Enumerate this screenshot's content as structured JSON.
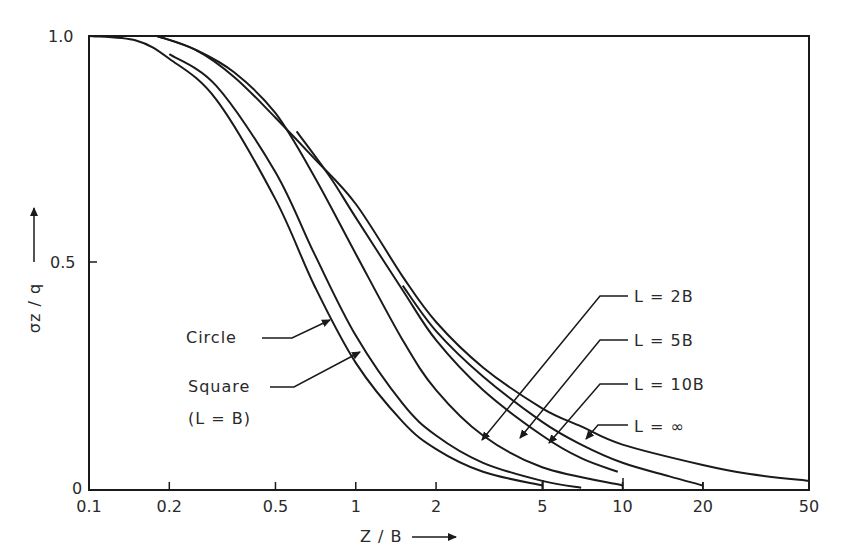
{
  "chart_data": {
    "type": "line",
    "title": "",
    "xlabel": "Z / B",
    "ylabel": "σz / q",
    "x_scale": "log",
    "xlim": [
      0.1,
      50
    ],
    "ylim": [
      0,
      1.0
    ],
    "grid": false,
    "x_ticks": [
      "0.1",
      "0.2",
      "0.5",
      "1",
      "2",
      "5",
      "10",
      "20",
      "50"
    ],
    "y_ticks": [
      "0",
      "0.5",
      "1.0"
    ],
    "legend_position": "inline annotations with arrows",
    "series": [
      {
        "name": "Circle",
        "x": [
          0.1,
          0.15,
          0.2,
          0.3,
          0.5,
          0.7,
          1,
          1.5,
          2,
          3,
          5
        ],
        "values": [
          1.0,
          0.99,
          0.95,
          0.86,
          0.64,
          0.45,
          0.28,
          0.15,
          0.09,
          0.04,
          0.01
        ]
      },
      {
        "name": "Square (L = B)",
        "x": [
          0.2,
          0.3,
          0.5,
          0.7,
          1,
          1.5,
          2,
          3,
          5,
          7
        ],
        "values": [
          0.96,
          0.89,
          0.7,
          0.52,
          0.34,
          0.19,
          0.12,
          0.06,
          0.02,
          0.005
        ]
      },
      {
        "name": "L = 2B",
        "x": [
          0.18,
          0.25,
          0.35,
          0.5,
          0.7,
          1,
          1.5,
          2,
          3,
          5,
          10
        ],
        "values": [
          1.0,
          0.97,
          0.92,
          0.83,
          0.69,
          0.52,
          0.33,
          0.22,
          0.12,
          0.05,
          0.01
        ]
      },
      {
        "name": "L = 5B",
        "x": [
          0.6,
          0.8,
          1,
          1.5,
          2,
          3,
          5,
          7,
          9.6
        ],
        "values": [
          0.79,
          0.69,
          0.6,
          0.44,
          0.33,
          0.22,
          0.12,
          0.07,
          0.04
        ]
      },
      {
        "name": "L = 10B",
        "x": [
          1.5,
          2,
          3,
          5,
          7,
          10,
          15,
          20
        ],
        "values": [
          0.45,
          0.35,
          0.25,
          0.15,
          0.1,
          0.06,
          0.03,
          0.01
        ]
      },
      {
        "name": "L = ∞",
        "x": [
          0.18,
          0.25,
          0.35,
          0.5,
          0.7,
          1,
          1.5,
          2,
          3,
          5,
          7,
          10,
          20,
          30,
          50
        ],
        "values": [
          1.0,
          0.97,
          0.91,
          0.82,
          0.73,
          0.63,
          0.47,
          0.37,
          0.27,
          0.18,
          0.14,
          0.1,
          0.055,
          0.035,
          0.02
        ]
      }
    ],
    "annotations": [
      {
        "text": "Circle",
        "arrow_to_series": "Circle"
      },
      {
        "text": "Square",
        "arrow_to_series": "Square (L = B)"
      },
      {
        "text": "(L = B)"
      },
      {
        "text": "L = 2B",
        "arrow_to_series": "L = 2B"
      },
      {
        "text": "L = 5B",
        "arrow_to_series": "L = 5B"
      },
      {
        "text": "L = 10B",
        "arrow_to_series": "L = 10B"
      },
      {
        "text": "L = ∞",
        "arrow_to_series": "L = ∞"
      }
    ]
  },
  "labels": {
    "y_axis": "σz / q",
    "x_axis": "Z / B",
    "circle": "Circle",
    "square": "Square",
    "square_sub": "(L = B)",
    "l2b": "L = 2B",
    "l5b": "L = 5B",
    "l10b": "L = 10B",
    "linf": "L = ∞"
  },
  "colors": {
    "ink": "#1a1a1a",
    "background": "#ffffff"
  }
}
